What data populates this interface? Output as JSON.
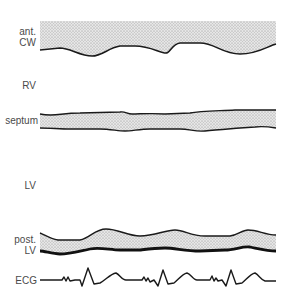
{
  "labels": {
    "ant": "ant.",
    "cw": "CW",
    "rv": "RV",
    "septum": "septum",
    "lv": "LV",
    "post": "post.",
    "post_lv": "LV",
    "ecg": "ECG"
  },
  "colors": {
    "stipple_bg": "#e4e4e4",
    "stipple_dot": "#8a8a8a",
    "line": "#1a1a1a",
    "text": "#4a4a4a"
  },
  "paths": {
    "ant_cw_fill": "M40,21 L276,21 L276,44 C268,46 258,54 240,54 C222,54 215,43 200,43 L180,43 C172,44 170,53 166,53 C160,53 150,46 135,46 L120,46 C108,48 102,56 92,56 C80,56 70,48 60,48 L40,50 Z",
    "ant_cw_edge": "M40,50 L60,48 C70,48 80,56 92,56 C102,56 108,48 120,46 L135,46 C150,46 160,53 166,53 C170,53 172,44 180,43 L200,43 C215,43 222,54 240,54 C258,54 268,46 276,44",
    "septum_fill": "M40,114 C55,117 60,113 80,113 L120,112 C125,111 127,114 132,114 C140,114 150,113 165,114 L190,113 C200,111 215,111 235,110 L276,110 L276,128 C270,127 262,126 255,127 L240,128 C228,129 215,130 205,131 C195,132 190,129 180,129 L150,129 C140,129 132,131 125,131 C118,131 110,129 100,129 L70,129 C60,129 50,128 40,128 Z",
    "septum_top": "M40,114 C55,117 60,113 80,113 L120,112 C125,111 127,114 132,114 C140,114 150,113 165,114 L190,113 C200,111 215,111 235,110 L276,110",
    "septum_bottom": "M40,128 C50,128 60,129 70,129 L100,129 C110,129 118,131 125,131 C132,131 140,129 150,129 L180,129 C190,129 195,132 205,131 C215,130 228,129 240,128 L255,127 C262,126 270,127 276,128",
    "post_lv_fill": "M40,233 C45,235 50,239 58,240 L80,240 C90,238 95,229 106,229 C118,229 128,236 140,236 C155,236 165,230 175,230 C185,230 190,236 205,236 L230,236 C238,235 242,230 248,230 C258,230 265,235 276,235 L276,251 C268,251 260,249 250,247 C242,246 235,250 225,250 L200,251 C185,251 175,248 165,248 C155,248 148,249 140,250 L120,250 C110,250 100,247 90,249 C80,251 70,254 60,254 C52,254 45,251 40,251 Z",
    "post_lv_top": "M40,233 C45,235 50,239 58,240 L80,240 C90,238 95,229 106,229 C118,229 128,236 140,236 C155,236 165,230 175,230 C185,230 190,236 205,236 L230,236 C238,235 242,230 248,230 C258,230 265,235 276,235",
    "post_lv_bottom": "M40,251 C45,251 52,254 60,254 C70,254 80,251 90,249 C100,247 110,250 120,250 L140,250 C148,249 155,248 165,248 C175,248 185,251 200,251 L225,250 C235,250 242,246 250,247 C260,249 268,251 276,251",
    "ecg": "M40,280 L62,280 L64,277 L66,281 L68,277 L70,281 L75,280 L80,280 L82,286 L88,268 L94,284 L100,283 C106,280 110,274 116,273 C120,275 122,280 126,280 L142,280 L144,277 L146,281 L148,278 L150,282 L154,280 L158,286 L163,270 L168,284 L174,283 C178,280 182,274 187,273 C191,274 193,280 197,280 L210,280 L212,276 L214,281 L216,278 L218,281 L222,280 L226,286 L231,270 L236,284 L242,283 C246,280 250,274 255,273 C259,275 261,280 265,281 L276,281",
    "ecg_lead": "M38,280 L40,280"
  }
}
